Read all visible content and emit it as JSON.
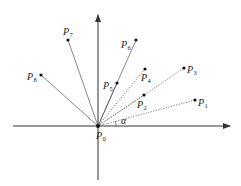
{
  "diagram": {
    "title": "",
    "origin": {
      "name": "P",
      "sub": "0",
      "x": 98,
      "y": 126,
      "label_x": 96,
      "label_y": 139
    },
    "axes": {
      "x_axis": {
        "x1": 13,
        "y1": 126,
        "x2": 230,
        "y2": 126
      },
      "y_axis": {
        "x1": 98,
        "y1": 180,
        "x2": 98,
        "y2": 15
      }
    },
    "angle": {
      "label": "α",
      "arc_cx": 98,
      "arc_cy": 126,
      "radius": 18,
      "label_x": 121,
      "label_y": 124
    },
    "points": [
      {
        "name": "P",
        "sub": "1",
        "x": 195,
        "y": 100,
        "label_x": 198,
        "label_y": 106,
        "line_style": "dotted"
      },
      {
        "name": "P",
        "sub": "2",
        "x": 144,
        "y": 95,
        "label_x": 137,
        "label_y": 108,
        "line_style": "dotted"
      },
      {
        "name": "P",
        "sub": "3",
        "x": 184,
        "y": 68,
        "label_x": 187,
        "label_y": 73,
        "line_style": "dotted"
      },
      {
        "name": "P",
        "sub": "4",
        "x": 145,
        "y": 69,
        "label_x": 141,
        "label_y": 81,
        "line_style": "dotted"
      },
      {
        "name": "P",
        "sub": "5",
        "x": 117,
        "y": 83,
        "label_x": 103,
        "label_y": 89,
        "line_style": "solid"
      },
      {
        "name": "P",
        "sub": "6",
        "x": 136,
        "y": 40,
        "label_x": 121,
        "label_y": 48,
        "line_style": "solid"
      },
      {
        "name": "P",
        "sub": "7",
        "x": 68,
        "y": 40,
        "label_x": 63,
        "label_y": 35,
        "line_style": "solid"
      },
      {
        "name": "P",
        "sub": "8",
        "x": 41,
        "y": 75,
        "label_x": 27,
        "label_y": 80,
        "line_style": "solid"
      }
    ],
    "colors": {
      "axis": "#333333",
      "ray": "#555555",
      "point": "#111111",
      "text": "#222222"
    }
  }
}
